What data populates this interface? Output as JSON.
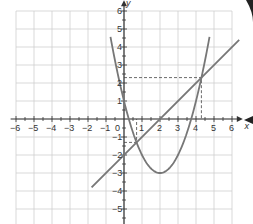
{
  "chart_data": {
    "type": "line",
    "title": "",
    "xlabel": "x",
    "ylabel": "y",
    "xlim": [
      -6,
      6
    ],
    "ylim": [
      -6,
      7
    ],
    "grid": true,
    "x_ticks": [
      "-6",
      "-5",
      "-4",
      "-3",
      "-2",
      "-1",
      "0",
      "1",
      "2",
      "3",
      "4",
      "5",
      "6"
    ],
    "y_ticks": [
      "6",
      "5",
      "4",
      "3",
      "2",
      "1",
      "-1",
      "-2",
      "-3",
      "-4",
      "-5"
    ],
    "series": [
      {
        "name": "parabola",
        "equation": "y = x^2 - 4x + 1",
        "vertex": [
          2,
          -3
        ],
        "y_intercept": 1
      },
      {
        "name": "line",
        "equation": "y = x - 2",
        "x_range": [
          -1.8,
          6.4
        ]
      }
    ],
    "intersections": [
      {
        "x": 0.7,
        "y": -1.3
      },
      {
        "x": 4.3,
        "y": 2.3
      }
    ],
    "annotations": [
      "dashed guides from intersection points to axes"
    ]
  },
  "axes": {
    "x_label": "x",
    "y_label": "y"
  }
}
